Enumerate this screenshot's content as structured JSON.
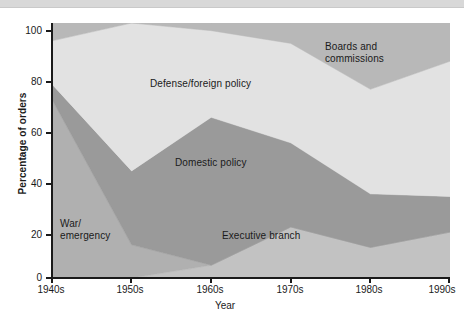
{
  "chart_data": {
    "type": "area",
    "stacked": true,
    "title": "",
    "subtitle": "",
    "xlabel": "Year",
    "ylabel": "Percentage of orders",
    "categories": [
      "1940s",
      "1950s",
      "1960s",
      "1970s",
      "1980s",
      "1990s"
    ],
    "x_tick_labels": [
      "1940s",
      "1950s",
      "1960s",
      "1970s",
      "1980s",
      "1990s"
    ],
    "y_tick_labels": [
      "0",
      "20",
      "40",
      "60",
      "80",
      "100"
    ],
    "y_ticks": [
      0,
      20,
      40,
      60,
      80,
      100
    ],
    "ylim": [
      0,
      100
    ],
    "grid": false,
    "legend_position": "inline-annotations",
    "series": [
      {
        "name": "Executive branch",
        "color": "#c2c2c2",
        "values": [
          0,
          0,
          5,
          20,
          12,
          18
        ],
        "cumulative_top": [
          0,
          0,
          5,
          20,
          12,
          18
        ]
      },
      {
        "name": "War/emergency",
        "color": "#b0b0b0",
        "values": [
          70,
          13,
          0,
          0,
          0,
          0
        ],
        "cumulative_top": [
          70,
          13,
          5,
          20,
          12,
          18
        ]
      },
      {
        "name": "Domestic policy",
        "color": "#9a9a9a",
        "values": [
          6,
          29,
          58,
          33,
          21,
          14
        ],
        "cumulative_top": [
          76,
          42,
          63,
          53,
          33,
          32
        ]
      },
      {
        "name": "Defense/foreign policy",
        "color": "#e2e2e2",
        "values": [
          17,
          58,
          34,
          39,
          41,
          53
        ],
        "cumulative_top": [
          93,
          100,
          97,
          92,
          74,
          85
        ]
      },
      {
        "name": "Boards and commissions",
        "color": "#b8b8b8",
        "values": [
          7,
          0,
          3,
          8,
          26,
          15
        ],
        "cumulative_top": [
          100,
          100,
          100,
          100,
          100,
          100
        ]
      }
    ],
    "annotations": [
      {
        "text": "Boards and\ncommissions",
        "series": "Boards and commissions"
      },
      {
        "text": "Defense/foreign policy",
        "series": "Defense/foreign policy"
      },
      {
        "text": "Domestic policy",
        "series": "Domestic policy"
      },
      {
        "text": "Executive branch",
        "series": "Executive branch"
      },
      {
        "text": "War/\nemergency",
        "series": "War/emergency"
      }
    ]
  },
  "axes": {
    "ylabel": "Percentage of orders",
    "xlabel": "Year",
    "y_ticks": [
      {
        "value": 100,
        "label": "100"
      },
      {
        "value": 80,
        "label": "80"
      },
      {
        "value": 60,
        "label": "60"
      },
      {
        "value": 40,
        "label": "40"
      },
      {
        "value": 20,
        "label": "20"
      },
      {
        "value": 0,
        "label": "0"
      }
    ],
    "x_ticks": [
      {
        "label": "1940s"
      },
      {
        "label": "1950s"
      },
      {
        "label": "1960s"
      },
      {
        "label": "1970s"
      },
      {
        "label": "1980s"
      },
      {
        "label": "1990s"
      }
    ]
  },
  "labels": {
    "boards": "Boards and\ncommissions",
    "defense": "Defense/foreign policy",
    "domestic": "Domestic policy",
    "executive": "Executive branch",
    "war": "War/\nemergency"
  },
  "colors": {
    "executive_branch": "#c2c2c2",
    "war_emergency": "#b0b0b0",
    "domestic_policy": "#9a9a9a",
    "defense_foreign": "#e2e2e2",
    "boards_commissions": "#b8b8b8",
    "axis": "#1a1a1a",
    "background": "#ffffff",
    "top_strip": "#d8d8d8"
  }
}
